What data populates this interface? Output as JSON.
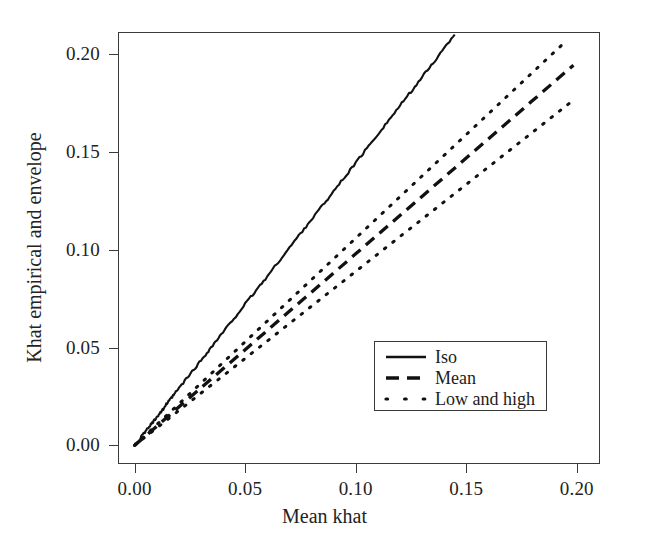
{
  "chart_data": {
    "type": "line",
    "title": "",
    "xlabel": "Mean khat",
    "ylabel": "Khat empirical and envelope",
    "xlim": [
      -0.0075,
      0.2105
    ],
    "ylim": [
      -0.0095,
      0.2115
    ],
    "xticks": [
      "0.00",
      "0.05",
      "0.10",
      "0.15",
      "0.20"
    ],
    "xtick_values": [
      0.0,
      0.05,
      0.1,
      0.15,
      0.2
    ],
    "yticks": [
      "0.00",
      "0.05",
      "0.10",
      "0.15",
      "0.20"
    ],
    "ytick_values": [
      0.0,
      0.05,
      0.1,
      0.15,
      0.2
    ],
    "grid": false,
    "legend_position": "lower-right",
    "background_color": "#ffffff",
    "line_color": "#111111",
    "series": [
      {
        "name": "Iso",
        "style": "solid",
        "points": [
          [
            0.0,
            0.0
          ],
          [
            0.002,
            0.0028
          ],
          [
            0.004,
            0.0058
          ],
          [
            0.006,
            0.0086
          ],
          [
            0.008,
            0.0116
          ],
          [
            0.01,
            0.0146
          ],
          [
            0.012,
            0.0172
          ],
          [
            0.014,
            0.0205
          ],
          [
            0.016,
            0.0232
          ],
          [
            0.018,
            0.0262
          ],
          [
            0.02,
            0.0291
          ],
          [
            0.024,
            0.0348
          ],
          [
            0.028,
            0.0405
          ],
          [
            0.032,
            0.0463
          ],
          [
            0.036,
            0.0521
          ],
          [
            0.04,
            0.0578
          ],
          [
            0.045,
            0.065
          ],
          [
            0.05,
            0.0722
          ],
          [
            0.055,
            0.0793
          ],
          [
            0.06,
            0.0864
          ],
          [
            0.065,
            0.0938
          ],
          [
            0.07,
            0.101
          ],
          [
            0.075,
            0.1084
          ],
          [
            0.08,
            0.1156
          ],
          [
            0.085,
            0.1228
          ],
          [
            0.09,
            0.13
          ],
          [
            0.095,
            0.1372
          ],
          [
            0.1,
            0.1445
          ],
          [
            0.105,
            0.1518
          ],
          [
            0.11,
            0.1592
          ],
          [
            0.115,
            0.1664
          ],
          [
            0.12,
            0.1737
          ],
          [
            0.125,
            0.181
          ],
          [
            0.13,
            0.1883
          ],
          [
            0.135,
            0.1956
          ],
          [
            0.14,
            0.203
          ],
          [
            0.1448,
            0.2105
          ]
        ]
      },
      {
        "name": "High",
        "style": "dotted",
        "legend_group": "Low and high",
        "points": [
          [
            0.0,
            0.0
          ],
          [
            0.01,
            0.0106
          ],
          [
            0.02,
            0.0212
          ],
          [
            0.03,
            0.0318
          ],
          [
            0.04,
            0.0424
          ],
          [
            0.05,
            0.053
          ],
          [
            0.06,
            0.0636
          ],
          [
            0.07,
            0.0742
          ],
          [
            0.08,
            0.0848
          ],
          [
            0.09,
            0.0954
          ],
          [
            0.1,
            0.106
          ],
          [
            0.11,
            0.1166
          ],
          [
            0.12,
            0.1272
          ],
          [
            0.13,
            0.1378
          ],
          [
            0.14,
            0.1484
          ],
          [
            0.15,
            0.159
          ],
          [
            0.16,
            0.1696
          ],
          [
            0.17,
            0.1802
          ],
          [
            0.18,
            0.1908
          ],
          [
            0.19,
            0.2014
          ],
          [
            0.1955,
            0.2072
          ]
        ]
      },
      {
        "name": "Mean",
        "style": "dashed",
        "points": [
          [
            0.0,
            0.0
          ],
          [
            0.01,
            0.0098
          ],
          [
            0.02,
            0.0196
          ],
          [
            0.03,
            0.0294
          ],
          [
            0.04,
            0.0392
          ],
          [
            0.05,
            0.049
          ],
          [
            0.06,
            0.0588
          ],
          [
            0.07,
            0.0686
          ],
          [
            0.08,
            0.0784
          ],
          [
            0.09,
            0.0882
          ],
          [
            0.1,
            0.098
          ],
          [
            0.11,
            0.1078
          ],
          [
            0.12,
            0.1176
          ],
          [
            0.13,
            0.1274
          ],
          [
            0.14,
            0.1372
          ],
          [
            0.15,
            0.147
          ],
          [
            0.16,
            0.1568
          ],
          [
            0.17,
            0.1666
          ],
          [
            0.18,
            0.1764
          ],
          [
            0.19,
            0.1862
          ],
          [
            0.1985,
            0.1945
          ]
        ]
      },
      {
        "name": "Low",
        "style": "dotted",
        "legend_group": "Low and high",
        "points": [
          [
            0.0,
            0.0
          ],
          [
            0.01,
            0.0089
          ],
          [
            0.02,
            0.0178
          ],
          [
            0.03,
            0.0267
          ],
          [
            0.04,
            0.0356
          ],
          [
            0.05,
            0.0445
          ],
          [
            0.06,
            0.0534
          ],
          [
            0.07,
            0.0623
          ],
          [
            0.08,
            0.0712
          ],
          [
            0.09,
            0.0801
          ],
          [
            0.1,
            0.089
          ],
          [
            0.11,
            0.0979
          ],
          [
            0.12,
            0.1068
          ],
          [
            0.13,
            0.1157
          ],
          [
            0.14,
            0.1246
          ],
          [
            0.15,
            0.1335
          ],
          [
            0.16,
            0.1424
          ],
          [
            0.17,
            0.1513
          ],
          [
            0.18,
            0.1602
          ],
          [
            0.19,
            0.1691
          ],
          [
            0.1985,
            0.1767
          ]
        ]
      }
    ],
    "legend_entries": [
      {
        "label": "Iso",
        "style": "solid"
      },
      {
        "label": "Mean",
        "style": "dashed"
      },
      {
        "label": "Low and high",
        "style": "dotted"
      }
    ]
  }
}
